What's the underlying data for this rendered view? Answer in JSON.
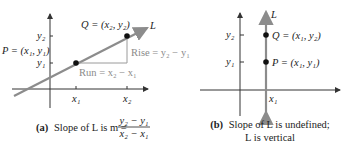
{
  "panel_a": {
    "point_q": "Q = (x₂, y₂)",
    "point_p": "P = (x₁, y₁)",
    "line_label": "L",
    "y2": "y₂",
    "y1": "y₁",
    "x1": "x₁",
    "x2": "x₂",
    "rise": "Rise = y₂ − y₁",
    "run": "Run = x₂ − x₁",
    "caption_letter": "(a)",
    "caption_text": "Slope of L is m =",
    "frac_num": "y₂ − y₁",
    "frac_den": "x₂ − x₁"
  },
  "panel_b": {
    "line_label": "L",
    "y2": "y₂",
    "y1": "y₁",
    "x1": "x₁",
    "point_q": "Q = (x₁, y₂)",
    "point_p": "P = (x₁, y₁)",
    "caption_letter": "(b)",
    "caption_line1": "Slope of L is undefined;",
    "caption_line2": "L is vertical"
  },
  "colors": {
    "axis": "#333333",
    "line_L": "#8c8c8c",
    "rise_run": "#9a9a9a",
    "point": "#111111"
  }
}
